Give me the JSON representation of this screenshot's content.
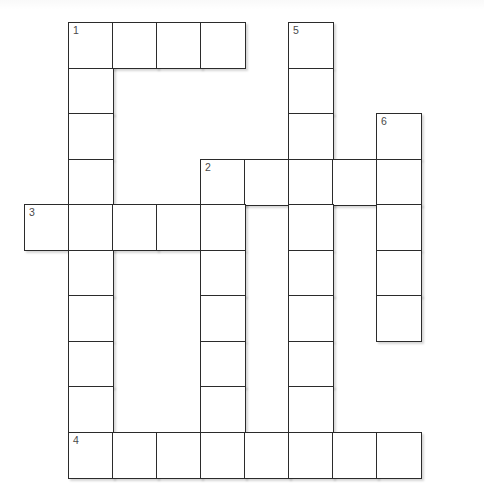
{
  "puzzle": {
    "title": "Crossword Puzzle Grid",
    "kind": "crossword",
    "grid": {
      "origin_x": 24,
      "origin_y": 22,
      "cell_width": 44,
      "cell_height": 45.5,
      "columns": 10,
      "rows": 10,
      "border_color": "#2b2b2b",
      "cell_fill": "#ffffff",
      "number_color": "#4a4a4a",
      "page_background": "#ffffff"
    },
    "clue_numbers": [
      {
        "label": "1",
        "col": 1,
        "row": 0,
        "direction": "across-and-down"
      },
      {
        "label": "2",
        "col": 4,
        "row": 3,
        "direction": "across-and-down"
      },
      {
        "label": "3",
        "col": 0,
        "row": 4,
        "direction": "across"
      },
      {
        "label": "4",
        "col": 1,
        "row": 9,
        "direction": "across"
      },
      {
        "label": "5",
        "col": 6,
        "row": 0,
        "direction": "down"
      },
      {
        "label": "6",
        "col": 8,
        "row": 2,
        "direction": "down"
      }
    ],
    "entries": [
      {
        "number": "1",
        "direction": "across",
        "col": 1,
        "row": 0,
        "length": 4
      },
      {
        "number": "1",
        "direction": "down",
        "col": 1,
        "row": 0,
        "length": 9
      },
      {
        "number": "2",
        "direction": "across",
        "col": 4,
        "row": 3,
        "length": 5
      },
      {
        "number": "2",
        "direction": "down",
        "col": 4,
        "row": 3,
        "length": 7
      },
      {
        "number": "3",
        "direction": "across",
        "col": 0,
        "row": 4,
        "length": 5
      },
      {
        "number": "4",
        "direction": "across",
        "col": 1,
        "row": 9,
        "length": 8
      },
      {
        "number": "5",
        "direction": "down",
        "col": 6,
        "row": 0,
        "length": 10
      },
      {
        "number": "6",
        "direction": "down",
        "col": 8,
        "row": 2,
        "length": 5
      }
    ],
    "cells": [
      {
        "col": 1,
        "row": 0,
        "number": "1",
        "letter": ""
      },
      {
        "col": 2,
        "row": 0,
        "number": "",
        "letter": ""
      },
      {
        "col": 3,
        "row": 0,
        "number": "",
        "letter": ""
      },
      {
        "col": 4,
        "row": 0,
        "number": "",
        "letter": ""
      },
      {
        "col": 6,
        "row": 0,
        "number": "5",
        "letter": ""
      },
      {
        "col": 1,
        "row": 1,
        "number": "",
        "letter": ""
      },
      {
        "col": 6,
        "row": 1,
        "number": "",
        "letter": ""
      },
      {
        "col": 1,
        "row": 2,
        "number": "",
        "letter": ""
      },
      {
        "col": 6,
        "row": 2,
        "number": "",
        "letter": ""
      },
      {
        "col": 8,
        "row": 2,
        "number": "6",
        "letter": ""
      },
      {
        "col": 1,
        "row": 3,
        "number": "",
        "letter": ""
      },
      {
        "col": 4,
        "row": 3,
        "number": "2",
        "letter": ""
      },
      {
        "col": 5,
        "row": 3,
        "number": "",
        "letter": ""
      },
      {
        "col": 6,
        "row": 3,
        "number": "",
        "letter": ""
      },
      {
        "col": 7,
        "row": 3,
        "number": "",
        "letter": ""
      },
      {
        "col": 8,
        "row": 3,
        "number": "",
        "letter": ""
      },
      {
        "col": 0,
        "row": 4,
        "number": "3",
        "letter": ""
      },
      {
        "col": 1,
        "row": 4,
        "number": "",
        "letter": ""
      },
      {
        "col": 2,
        "row": 4,
        "number": "",
        "letter": ""
      },
      {
        "col": 3,
        "row": 4,
        "number": "",
        "letter": ""
      },
      {
        "col": 4,
        "row": 4,
        "number": "",
        "letter": ""
      },
      {
        "col": 6,
        "row": 4,
        "number": "",
        "letter": ""
      },
      {
        "col": 8,
        "row": 4,
        "number": "",
        "letter": ""
      },
      {
        "col": 1,
        "row": 5,
        "number": "",
        "letter": ""
      },
      {
        "col": 4,
        "row": 5,
        "number": "",
        "letter": ""
      },
      {
        "col": 6,
        "row": 5,
        "number": "",
        "letter": ""
      },
      {
        "col": 8,
        "row": 5,
        "number": "",
        "letter": ""
      },
      {
        "col": 1,
        "row": 6,
        "number": "",
        "letter": ""
      },
      {
        "col": 4,
        "row": 6,
        "number": "",
        "letter": ""
      },
      {
        "col": 6,
        "row": 6,
        "number": "",
        "letter": ""
      },
      {
        "col": 8,
        "row": 6,
        "number": "",
        "letter": ""
      },
      {
        "col": 1,
        "row": 7,
        "number": "",
        "letter": ""
      },
      {
        "col": 4,
        "row": 7,
        "number": "",
        "letter": ""
      },
      {
        "col": 6,
        "row": 7,
        "number": "",
        "letter": ""
      },
      {
        "col": 1,
        "row": 8,
        "number": "",
        "letter": ""
      },
      {
        "col": 4,
        "row": 8,
        "number": "",
        "letter": ""
      },
      {
        "col": 6,
        "row": 8,
        "number": "",
        "letter": ""
      },
      {
        "col": 1,
        "row": 9,
        "number": "4",
        "letter": ""
      },
      {
        "col": 2,
        "row": 9,
        "number": "",
        "letter": ""
      },
      {
        "col": 3,
        "row": 9,
        "number": "",
        "letter": ""
      },
      {
        "col": 4,
        "row": 9,
        "number": "",
        "letter": ""
      },
      {
        "col": 5,
        "row": 9,
        "number": "",
        "letter": ""
      },
      {
        "col": 6,
        "row": 9,
        "number": "",
        "letter": ""
      },
      {
        "col": 7,
        "row": 9,
        "number": "",
        "letter": ""
      },
      {
        "col": 8,
        "row": 9,
        "number": "",
        "letter": ""
      }
    ]
  }
}
